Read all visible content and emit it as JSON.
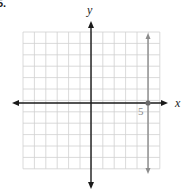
{
  "problem_number": "5.",
  "chart_data": {
    "type": "line",
    "title": "",
    "xlabel": "x",
    "ylabel": "y",
    "xlim": [
      -6,
      6
    ],
    "ylim": [
      -6,
      6
    ],
    "grid": true,
    "grid_step": 1,
    "series": [
      {
        "name": "x = 5",
        "kind": "vertical-line",
        "x": [
          5,
          5
        ],
        "y": [
          -6,
          6
        ],
        "arrows": "both",
        "color": "#8c8c8c"
      }
    ],
    "points": [
      {
        "x": 5,
        "y": 0
      }
    ],
    "annotations": [
      {
        "text": "5",
        "x": 5,
        "y": 0,
        "position": "below-left"
      }
    ]
  },
  "labels": {
    "x_axis": "x",
    "y_axis": "y",
    "tick_5": "5"
  },
  "colors": {
    "grid": "#d0d0d0",
    "axis": "#1a1a1a",
    "line": "#8c8c8c"
  }
}
